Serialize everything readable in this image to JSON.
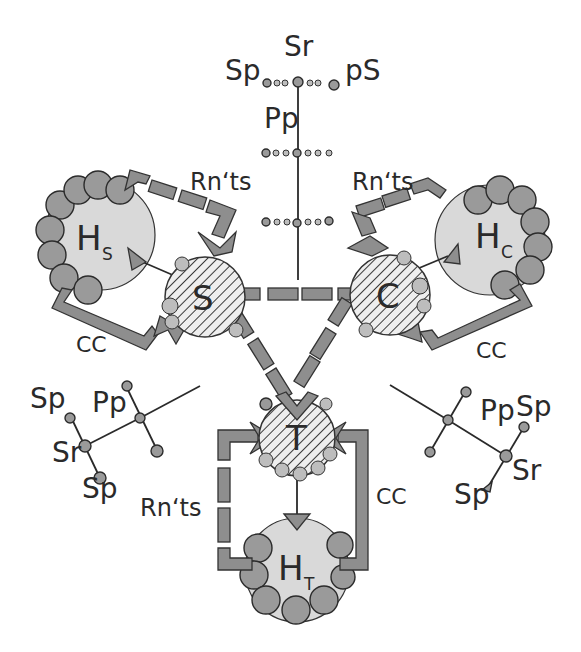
{
  "diagram": {
    "title": "",
    "top_cluster": {
      "labels": {
        "left": "Sp",
        "center": "Sr",
        "right": "pS",
        "stem": "Pp"
      }
    },
    "left_cluster": {
      "labels": {
        "top": "Sp",
        "center": "Sr",
        "bottom": "Sp",
        "stem": "Pp"
      }
    },
    "right_cluster": {
      "labels": {
        "top": "Sp",
        "center": "Sr",
        "bottom": "Sp",
        "stem": "Pp"
      }
    },
    "cores": [
      {
        "id": "S",
        "label": "S"
      },
      {
        "id": "C",
        "label": "C"
      },
      {
        "id": "T",
        "label": "T"
      }
    ],
    "halos": [
      {
        "id": "HS",
        "main": "H",
        "sub": "S"
      },
      {
        "id": "HC",
        "main": "H",
        "sub": "C"
      },
      {
        "id": "HT",
        "main": "H",
        "sub": "T"
      }
    ],
    "connector_labels": {
      "rnts_left": "Rn‘ts",
      "rnts_right": "Rn‘ts",
      "rnts_bottom": "Rn‘ts",
      "cc_left": "CC",
      "cc_right": "CC",
      "cc_bottom": "CC"
    },
    "colors": {
      "bead": "#9a9a9a",
      "halo": "#d9d9d9",
      "bar": "#8e8e8e",
      "ink": "#2a2a2a"
    }
  }
}
